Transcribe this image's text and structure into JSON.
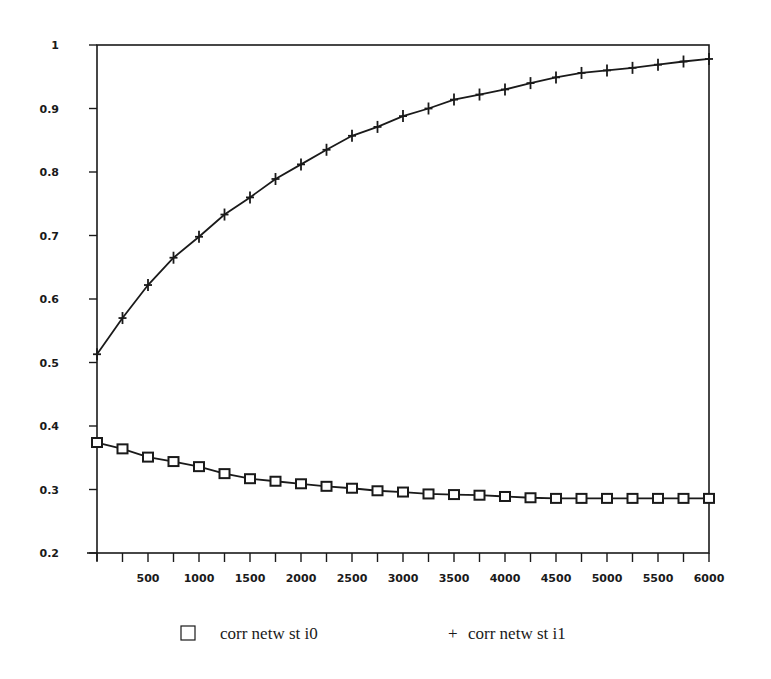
{
  "chart_data": {
    "type": "line",
    "title": "",
    "xlabel": "",
    "ylabel": "",
    "xlim": [
      0,
      6000
    ],
    "ylim": [
      0.2,
      1.0
    ],
    "grid": false,
    "legend_position": "bottom",
    "x_ticks": [
      "500",
      "1000",
      "1500",
      "2000",
      "2500",
      "3000",
      "3500",
      "4000",
      "4500",
      "5000",
      "5500",
      "6000"
    ],
    "y_ticks": [
      "1",
      "0.9",
      "0.8",
      "0.7",
      "0.6",
      "0.5",
      "0.4",
      "0.3",
      "0.2"
    ],
    "x": [
      0,
      250,
      500,
      750,
      1000,
      1250,
      1500,
      1750,
      2000,
      2250,
      2500,
      2750,
      3000,
      3250,
      3500,
      3750,
      4000,
      4250,
      4500,
      4750,
      5000,
      5250,
      5500,
      5750,
      6000
    ],
    "series": [
      {
        "name": "corr netw st i0",
        "marker": "square",
        "values": [
          0.374,
          0.364,
          0.351,
          0.344,
          0.336,
          0.325,
          0.317,
          0.313,
          0.309,
          0.305,
          0.302,
          0.298,
          0.296,
          0.293,
          0.292,
          0.291,
          0.289,
          0.287,
          0.286,
          0.286,
          0.286,
          0.286,
          0.286,
          0.286,
          0.286
        ]
      },
      {
        "name": "corr netw st i1",
        "marker": "plus",
        "values": [
          0.513,
          0.57,
          0.622,
          0.665,
          0.698,
          0.733,
          0.76,
          0.789,
          0.812,
          0.835,
          0.857,
          0.871,
          0.888,
          0.9,
          0.914,
          0.922,
          0.93,
          0.94,
          0.949,
          0.956,
          0.96,
          0.964,
          0.969,
          0.974,
          0.978
        ]
      }
    ]
  },
  "legend": {
    "items": [
      {
        "symbol": "square",
        "label": "corr netw st i0"
      },
      {
        "symbol": "+",
        "label": "corr netw st i1"
      }
    ]
  },
  "colors": {
    "ink": "#1a1a1a",
    "background": "#ffffff"
  }
}
